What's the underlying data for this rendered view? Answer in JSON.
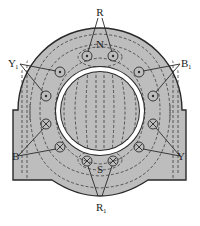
{
  "diagram": {
    "colors": {
      "stator": "#bdbdbd",
      "outline": "#2a2a2a",
      "gap": "#ffffff",
      "rotor": "#bdbdbd",
      "flux": "#3a3a3a"
    },
    "poles": {
      "north": "N",
      "south": "S"
    },
    "labels": {
      "R": "R",
      "R1": "R",
      "R1_sub": "1",
      "Y": "Y",
      "Y1": "Y",
      "Y1_sub": "1",
      "B": "B",
      "B1": "B",
      "B1_sub": "1"
    },
    "conductors": [
      {
        "id": "R-a",
        "x": 87,
        "y": 56,
        "type": "dot"
      },
      {
        "id": "R-b",
        "x": 113,
        "y": 56,
        "type": "dot"
      },
      {
        "id": "Y1-a",
        "x": 60,
        "y": 72,
        "type": "dot"
      },
      {
        "id": "Y1-b",
        "x": 46,
        "y": 96,
        "type": "dot"
      },
      {
        "id": "B1-a",
        "x": 139,
        "y": 72,
        "type": "dot"
      },
      {
        "id": "B1-b",
        "x": 153,
        "y": 96,
        "type": "dot"
      },
      {
        "id": "B-a",
        "x": 46,
        "y": 124,
        "type": "cross"
      },
      {
        "id": "B-b",
        "x": 60,
        "y": 147,
        "type": "cross"
      },
      {
        "id": "Y-a",
        "x": 153,
        "y": 124,
        "type": "cross"
      },
      {
        "id": "Y-b",
        "x": 139,
        "y": 147,
        "type": "cross"
      },
      {
        "id": "R1-a",
        "x": 87,
        "y": 161,
        "type": "cross"
      },
      {
        "id": "R1-b",
        "x": 113,
        "y": 161,
        "type": "cross"
      }
    ]
  }
}
